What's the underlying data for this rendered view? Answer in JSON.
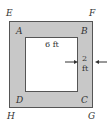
{
  "figure": {
    "outer_labels": {
      "E": "E",
      "F": "F",
      "G": "G",
      "H": "H"
    },
    "inner_labels": {
      "A": "A",
      "B": "B",
      "C": "C",
      "D": "D"
    },
    "inner_width_label": "6 ft",
    "border_width_label_top": "2",
    "border_width_label_bottom": "ft",
    "colors": {
      "border_fill": "#c8c8c8",
      "inner_fill": "#ffffff",
      "line": "#555555"
    }
  }
}
